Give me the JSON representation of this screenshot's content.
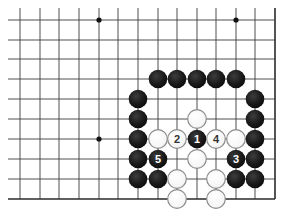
{
  "board": {
    "type": "go-diagram",
    "columns": 14,
    "rows": 10,
    "col_x": [
      20,
      40,
      59,
      79,
      99,
      118,
      138,
      158,
      177,
      197,
      216,
      236,
      255,
      275
    ],
    "row_y": [
      20,
      40,
      59,
      79,
      99,
      119,
      139,
      159,
      179,
      199
    ],
    "open_edge_extent": {
      "left_x": 8,
      "top_y": 8
    },
    "closed_edges": [
      "right",
      "bottom"
    ],
    "stone_radius": 9.3,
    "colors": {
      "black": "#1a1a1a",
      "white": "#ffffff",
      "white_outline": "#8c8c8c",
      "grid": "#3a3a3a"
    },
    "star_points": [
      {
        "c": 4,
        "r": 0
      },
      {
        "c": 11,
        "r": 0
      },
      {
        "c": 4,
        "r": 6
      }
    ],
    "stones": [
      {
        "c": 7,
        "r": 3,
        "color": "black",
        "label": ""
      },
      {
        "c": 8,
        "r": 3,
        "color": "black",
        "label": ""
      },
      {
        "c": 9,
        "r": 3,
        "color": "black",
        "label": ""
      },
      {
        "c": 10,
        "r": 3,
        "color": "black",
        "label": ""
      },
      {
        "c": 11,
        "r": 3,
        "color": "black",
        "label": ""
      },
      {
        "c": 6,
        "r": 4,
        "color": "black",
        "label": ""
      },
      {
        "c": 12,
        "r": 4,
        "color": "black",
        "label": ""
      },
      {
        "c": 6,
        "r": 5,
        "color": "black",
        "label": ""
      },
      {
        "c": 9,
        "r": 5,
        "color": "white",
        "label": ""
      },
      {
        "c": 12,
        "r": 5,
        "color": "black",
        "label": ""
      },
      {
        "c": 6,
        "r": 6,
        "color": "black",
        "label": ""
      },
      {
        "c": 7,
        "r": 6,
        "color": "white",
        "label": ""
      },
      {
        "c": 8,
        "r": 6,
        "color": "white",
        "label": "2"
      },
      {
        "c": 9,
        "r": 6,
        "color": "black",
        "label": "1"
      },
      {
        "c": 10,
        "r": 6,
        "color": "white",
        "label": "4"
      },
      {
        "c": 11,
        "r": 6,
        "color": "white",
        "label": ""
      },
      {
        "c": 12,
        "r": 6,
        "color": "black",
        "label": ""
      },
      {
        "c": 6,
        "r": 7,
        "color": "black",
        "label": ""
      },
      {
        "c": 7,
        "r": 7,
        "color": "black",
        "label": "5"
      },
      {
        "c": 9,
        "r": 7,
        "color": "white",
        "label": ""
      },
      {
        "c": 11,
        "r": 7,
        "color": "black",
        "label": "3"
      },
      {
        "c": 12,
        "r": 7,
        "color": "black",
        "label": ""
      },
      {
        "c": 6,
        "r": 8,
        "color": "black",
        "label": ""
      },
      {
        "c": 7,
        "r": 8,
        "color": "black",
        "label": ""
      },
      {
        "c": 8,
        "r": 8,
        "color": "white",
        "label": ""
      },
      {
        "c": 10,
        "r": 8,
        "color": "white",
        "label": ""
      },
      {
        "c": 11,
        "r": 8,
        "color": "black",
        "label": ""
      },
      {
        "c": 12,
        "r": 8,
        "color": "black",
        "label": ""
      },
      {
        "c": 8,
        "r": 9,
        "color": "white",
        "label": ""
      },
      {
        "c": 10,
        "r": 9,
        "color": "white",
        "label": ""
      }
    ],
    "move_sequence": [
      {
        "move": "1",
        "color": "black"
      },
      {
        "move": "2",
        "color": "white"
      },
      {
        "move": "3",
        "color": "black"
      },
      {
        "move": "4",
        "color": "white"
      },
      {
        "move": "5",
        "color": "black"
      }
    ]
  }
}
